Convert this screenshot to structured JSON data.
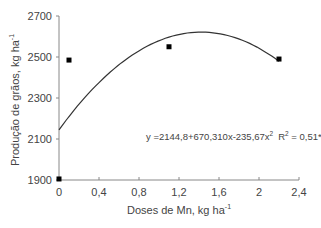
{
  "chart_data": {
    "type": "scatter",
    "title": "",
    "xlabel": "Doses de Mn, kg ha",
    "xlabel_sup": "-1",
    "ylabel": "Produção de grãos, kg ha",
    "ylabel_sup": "-1",
    "xlim": [
      0,
      2.4
    ],
    "ylim": [
      1900,
      2700
    ],
    "x_ticks": [
      0,
      0.4,
      0.8,
      1.2,
      1.6,
      2.0,
      2.4
    ],
    "x_tick_labels": [
      "0",
      "0,4",
      "0,8",
      "1,2",
      "1,6",
      "2",
      "2,4"
    ],
    "y_ticks": [
      1900,
      2100,
      2300,
      2500,
      2700
    ],
    "y_tick_labels": [
      "1900",
      "2100",
      "2300",
      "2500",
      "2700"
    ],
    "grid": false,
    "legend": null,
    "series": [
      {
        "name": "observed",
        "marker": "square",
        "color": "#000000",
        "points": [
          {
            "x": 0,
            "y": 1905
          },
          {
            "x": 0.1,
            "y": 2485
          },
          {
            "x": 1.1,
            "y": 2550
          },
          {
            "x": 2.2,
            "y": 2490
          }
        ]
      },
      {
        "name": "fitted quadratic",
        "type": "line",
        "color": "#333333",
        "equation": {
          "a": 2144.8,
          "b": 670.31,
          "c": -235.67
        },
        "x_range": [
          0,
          2.2
        ]
      }
    ],
    "annotations": [
      {
        "text": "y =2144,8+670,310x-235,67x",
        "sup": "2",
        "text2": "R",
        "sup2": "2",
        "text3": " = 0,51*"
      }
    ]
  }
}
